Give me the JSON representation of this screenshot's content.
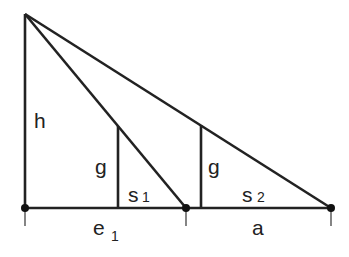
{
  "diagram": {
    "type": "geometry-similar-triangles",
    "points": {
      "apex": [
        25,
        14
      ],
      "base_left": [
        25,
        208
      ],
      "base_mid": [
        186,
        208
      ],
      "base_right": [
        331,
        208
      ],
      "g1_bottom": [
        118,
        208
      ],
      "g1_top": [
        118,
        126
      ],
      "g2_bottom": [
        201,
        208
      ],
      "g2_top": [
        201,
        125
      ]
    },
    "labels": {
      "h": "h",
      "g1": "g",
      "g2": "g",
      "s1": "s",
      "s1_sub": "1",
      "s2": "s",
      "s2_sub": "2",
      "e1": "e",
      "e1_sub": "1",
      "a": "a"
    },
    "colors": {
      "stroke": "#222222",
      "background": "#ffffff"
    }
  }
}
